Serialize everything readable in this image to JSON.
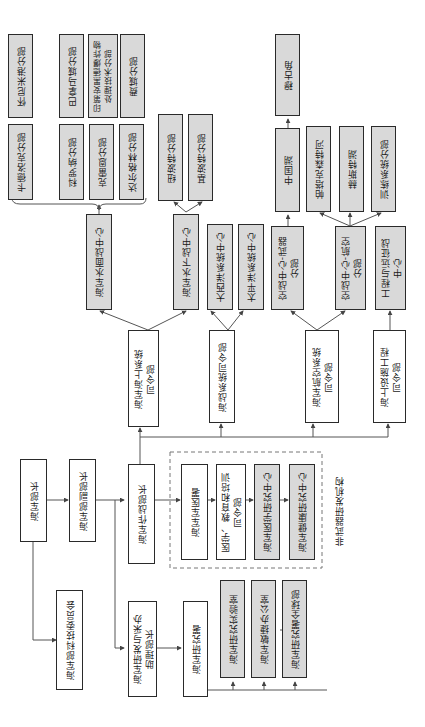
{
  "diagram": {
    "orientation": "rotated-90-ccw",
    "colors": {
      "gray_fill": "#d9d9d9",
      "white_fill": "#ffffff",
      "border": "#2a2a2a",
      "line": "#555555"
    },
    "nodes": {
      "secretary": "海军部长",
      "under_secretary": "海军部副部长",
      "tech_committee": "海军部科技委员会",
      "cno": "海军作战部长",
      "asn_rda": "海军研发与采办\n助理部长",
      "onr": "海军研究署",
      "nrl": "海军研究实验室",
      "rapid_office": "海军敏捷办公室",
      "onr_global": "海军研究署全球部",
      "bumed": "海军军医署",
      "med_command": "医学、教育和培训\n司令部",
      "med_research": "海军医学研究中心",
      "health_research": "海军健康研究中心",
      "navsea": "海军海上系统\n司令部",
      "nswc": "海军水面战中心",
      "nuwc": "海军水下战中心",
      "warfare_cmd": "海战系统司令部",
      "atlantic": "大西洋系统中心",
      "pacific": "太平洋系统中心",
      "navair": "海军航空系统\n司令部",
      "awc_weapons": "空战中心-武器\n分部",
      "awc_aircraft": "空战中心-航空\n分部",
      "navfac": "海上设施工程\n司令部",
      "exwc": "工程与远征战\n中心",
      "china_lake": "中国湖",
      "point_mugu": "穆古角",
      "patuxent": "帕塔克森特河",
      "lakehurst": "赫斯特湖",
      "training": "训练系统分部",
      "newport": "纽波特分部",
      "keyport": "基波特分部",
      "crane": "克雷恩分部",
      "dahlgren": "达尔格林分部",
      "corona": "科罗纳分部",
      "carderock": "卡德洛克分部",
      "port_hueneme": "怀尼米港分部",
      "panama_city": "巴拿马城分部",
      "indian_head": "印第安黑德爆炸物处理技术分部",
      "philadelphia": "费城分部"
    },
    "group_label": "非武器研发机构"
  }
}
